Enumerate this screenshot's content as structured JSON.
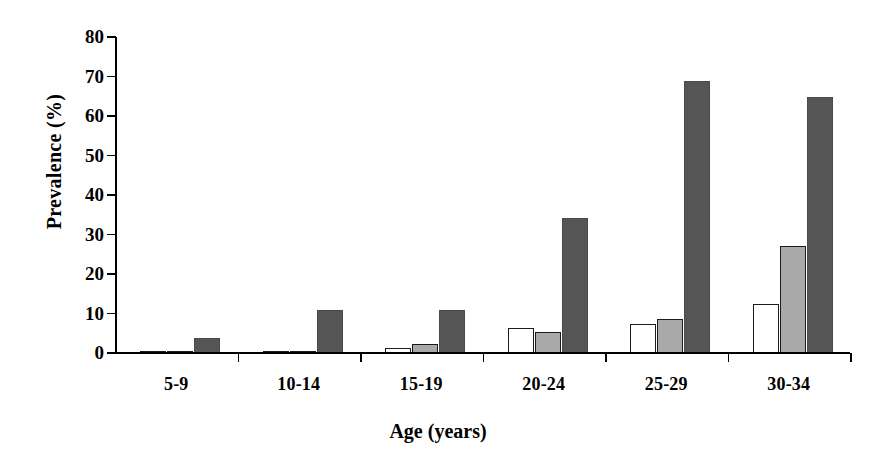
{
  "chart_data": {
    "type": "bar",
    "title": "",
    "xlabel": "Age (years)",
    "ylabel": "Prevalence (%)",
    "categories": [
      "5-9",
      "10-14",
      "15-19",
      "20-24",
      "25-29",
      "30-34"
    ],
    "ylim": [
      0,
      80
    ],
    "yticks": [
      0,
      10,
      20,
      30,
      40,
      50,
      60,
      70,
      80
    ],
    "ytick_labels": [
      "0",
      "10",
      "20",
      "30",
      "40",
      "50",
      "60",
      "70",
      "80"
    ],
    "grid": false,
    "legend": "none",
    "series": [
      {
        "name": "series-1-white",
        "fill": "#ffffff",
        "stroke": "#1a1a1a",
        "values": [
          0.4,
          0.4,
          1.3,
          6.4,
          7.3,
          12.5
        ]
      },
      {
        "name": "series-2-grey",
        "fill": "#a9a9a9",
        "stroke": "#1a1a1a",
        "values": [
          0.3,
          0.3,
          2.2,
          5.4,
          8.7,
          27.2
        ]
      },
      {
        "name": "series-3-dark",
        "fill": "#555555",
        "stroke": "#4a4a4a",
        "values": [
          3.8,
          10.8,
          10.9,
          34.2,
          68.8,
          64.9
        ]
      }
    ]
  },
  "colors": {
    "axis": "#000000",
    "bar_white": "#ffffff",
    "bar_grey": "#a9a9a9",
    "bar_dark": "#555555",
    "background": "#ffffff"
  }
}
